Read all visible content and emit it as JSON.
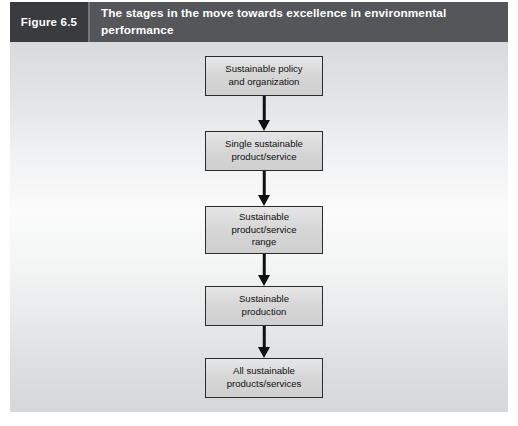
{
  "header": {
    "figure_number": "Figure 6.5",
    "title": "The stages in the move towards excellence in environmental performance",
    "number_block_color": "#3a3b3f",
    "bar_color": "#55565a",
    "text_color": "#ffffff"
  },
  "diagram": {
    "type": "flowchart",
    "direction": "top-to-bottom",
    "box_fill": "#d9d9d9",
    "box_border": "#2b2b2b",
    "arrow_color": "#111111",
    "stages": [
      {
        "label": "Sustainable policy and organization",
        "lines": [
          "Sustainable policy",
          "and organization"
        ]
      },
      {
        "label": "Single sustainable product/service",
        "lines": [
          "Single sustainable",
          "product/service"
        ]
      },
      {
        "label": "Sustainable product/service range",
        "lines": [
          "Sustainable",
          "product/service",
          "range"
        ]
      },
      {
        "label": "Sustainable production",
        "lines": [
          "Sustainable",
          "production"
        ]
      },
      {
        "label": "All sustainable products/services",
        "lines": [
          "All sustainable",
          "products/services"
        ]
      }
    ]
  }
}
